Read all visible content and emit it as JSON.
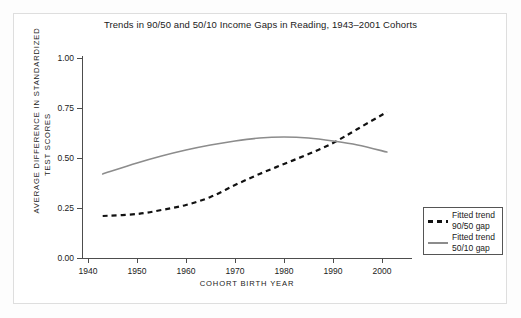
{
  "chart_data": {
    "type": "line",
    "title": "Trends in 90/50 and 50/10 Income Gaps in\nReading, 1943–2001 Cohorts",
    "xlabel": "COHORT BIRTH YEAR",
    "ylabel": "AVERAGE DIFFERENCE IN STANDARDIZED",
    "ylabel2": "TEST SCORES",
    "xlim": [
      1940,
      2005
    ],
    "ylim": [
      0.0,
      1.0
    ],
    "grid": false,
    "legend_position": "bottom-right",
    "xticks": [
      1940,
      1950,
      1960,
      1970,
      1980,
      1990,
      2000
    ],
    "xtick_labels": [
      "1940",
      "1950",
      "1960",
      "1970",
      "1980",
      "1990",
      "2000"
    ],
    "yticks": [
      0.0,
      0.25,
      0.5,
      0.75,
      1.0
    ],
    "ytick_labels": [
      "0.00",
      "0.25",
      "0.50",
      "0.75",
      "1.00"
    ],
    "series": [
      {
        "name": "Fitted trend\n90/50 gap",
        "style": "dashed",
        "color": "#111111",
        "x": [
          1943,
          1950,
          1955,
          1960,
          1965,
          1970,
          1975,
          1980,
          1985,
          1990,
          1995,
          2001
        ],
        "values": [
          0.21,
          0.22,
          0.24,
          0.265,
          0.305,
          0.365,
          0.42,
          0.47,
          0.52,
          0.575,
          0.645,
          0.73
        ]
      },
      {
        "name": "Fitted trend\n50/10 gap",
        "style": "solid",
        "color": "#8c8c8c",
        "x": [
          1943,
          1950,
          1955,
          1960,
          1965,
          1970,
          1975,
          1980,
          1985,
          1990,
          1995,
          2001
        ],
        "values": [
          0.42,
          0.475,
          0.51,
          0.54,
          0.565,
          0.585,
          0.6,
          0.605,
          0.6,
          0.585,
          0.565,
          0.53
        ]
      }
    ],
    "crossover_year": 1992,
    "crossover_value": 0.595
  },
  "legend": {
    "items": [
      {
        "label": "Fitted trend\n90/50 gap",
        "style": "dashed",
        "color": "#111111"
      },
      {
        "label": "Fitted trend\n50/10 gap",
        "style": "solid",
        "color": "#8c8c8c"
      }
    ]
  }
}
